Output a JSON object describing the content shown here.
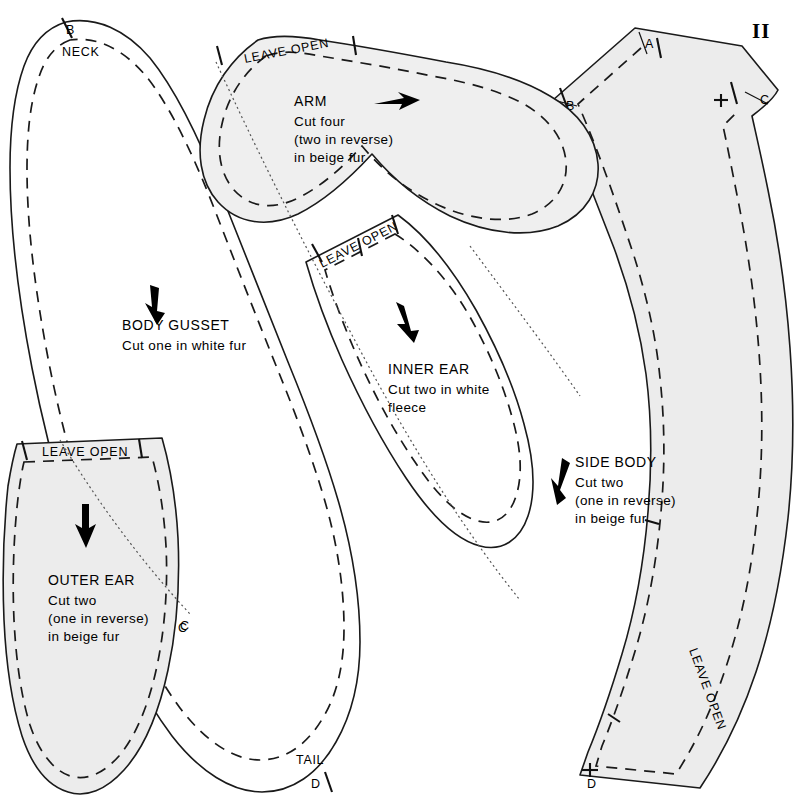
{
  "page": {
    "number": "II",
    "sheet_type": "sewing-pattern-sheet"
  },
  "colors": {
    "ink": "#1a1a1a",
    "piece_fill_light": "#ececec",
    "piece_fill_pale": "#f2f2f2",
    "background": "#ffffff"
  },
  "pieces": [
    {
      "id": "body-gusset",
      "title": "BODY GUSSET",
      "lines": [
        "Cut one in white fur"
      ],
      "fill": "none",
      "grain_arrow": "down",
      "notch_labels": [
        "B",
        "C",
        "D"
      ],
      "edge_labels": [
        "NECK",
        "TAIL"
      ]
    },
    {
      "id": "arm",
      "title": "ARM",
      "lines": [
        "Cut four",
        "(two in reverse)",
        "in beige fur"
      ],
      "fill": "light",
      "grain_arrow": "right",
      "open_label": "LEAVE OPEN"
    },
    {
      "id": "inner-ear",
      "title": "INNER EAR",
      "lines": [
        "Cut two in white",
        "fleece"
      ],
      "fill": "none",
      "grain_arrow": "down-right",
      "open_label": "LEAVE OPEN"
    },
    {
      "id": "outer-ear",
      "title": "OUTER EAR",
      "lines": [
        "Cut two",
        "(one in reverse)",
        "in beige fur"
      ],
      "fill": "light",
      "grain_arrow": "down",
      "open_label": "LEAVE OPEN",
      "notch_labels": [
        "C"
      ]
    },
    {
      "id": "side-body",
      "title": "SIDE BODY",
      "lines": [
        "Cut two",
        "(one in reverse)",
        "in beige fur"
      ],
      "fill": "light",
      "grain_arrow": "down-left",
      "open_label": "LEAVE OPEN",
      "notch_labels": [
        "A",
        "B",
        "C",
        "D"
      ]
    }
  ],
  "labels": {
    "leave_open": "LEAVE OPEN",
    "neck": "NECK",
    "tail": "TAIL",
    "notch_a": "A",
    "notch_b": "B",
    "notch_b2": "B",
    "notch_c": "C",
    "notch_c2": "C",
    "notch_c3": "C",
    "notch_d": "D",
    "notch_d2": "D"
  },
  "body_gusset": {
    "title": "BODY GUSSET",
    "line1": "Cut one in white fur"
  },
  "arm": {
    "title": "ARM",
    "line1": "Cut four",
    "line2": "(two in reverse)",
    "line3": "in beige fur"
  },
  "inner_ear": {
    "title": "INNER EAR",
    "line1": "Cut two in white",
    "line2": "fleece"
  },
  "outer_ear": {
    "title": "OUTER EAR",
    "line1": "Cut two",
    "line2": "(one in reverse)",
    "line3": "in beige fur"
  },
  "side_body": {
    "title": "SIDE BODY",
    "line1": "Cut two",
    "line2": "(one in reverse)",
    "line3": "in beige fur"
  }
}
